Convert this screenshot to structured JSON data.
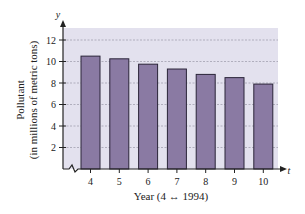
{
  "chart_data": {
    "type": "bar",
    "title": "",
    "xlabel": "Year (4 ↔ 1994)",
    "ylabel": "Pollutant (in millions of metric tons)",
    "ylabel_line1": "Pollutant",
    "ylabel_line2": "(in millions of metric tons)",
    "x_axis_var": "t",
    "y_axis_var": "y",
    "categories": [
      "4",
      "5",
      "6",
      "7",
      "8",
      "9",
      "10"
    ],
    "values": [
      10.5,
      10.25,
      9.75,
      9.3,
      8.8,
      8.5,
      7.9
    ],
    "yticks": [
      2,
      4,
      6,
      8,
      10,
      12
    ],
    "ylim": [
      0,
      13
    ],
    "grid": true,
    "axis_break": true,
    "legend": null
  },
  "colors": {
    "bar_fill": "#8a7aa3",
    "bar_stroke": "#2a2438",
    "plot_bg": "#e3e1ee",
    "grid": "#9a98a8",
    "axis": "#222222"
  }
}
